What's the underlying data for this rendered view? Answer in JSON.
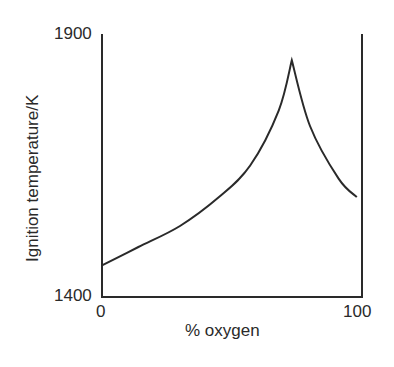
{
  "chart_data": {
    "type": "line",
    "title": "",
    "xlabel": "% oxygen",
    "ylabel": "Ignition temperature/K",
    "xlim": [
      0,
      100
    ],
    "ylim": [
      1400,
      1900
    ],
    "x_ticks": [
      "0",
      "100"
    ],
    "y_ticks": [
      "1400",
      "1900"
    ],
    "grid": false,
    "legend": null,
    "series": [
      {
        "name": "Ignition temperature",
        "x": [
          0,
          14,
          30,
          45,
          57,
          68,
          73,
          80,
          91,
          98
        ],
        "values": [
          1460,
          1495,
          1535,
          1590,
          1650,
          1755,
          1850,
          1725,
          1625,
          1590
        ]
      }
    ],
    "annotations": [
      "Sharp peak (cusp) at about 73% oxygen, ~1850 K"
    ]
  },
  "axes": {
    "x_min_label": "0",
    "x_max_label": "100",
    "y_min_label": "1400",
    "y_max_label": "1900",
    "x_title": "% oxygen",
    "y_title": "Ignition temperature/K"
  },
  "colors": {
    "line": "#2a2a2a",
    "background": "#ffffff"
  }
}
